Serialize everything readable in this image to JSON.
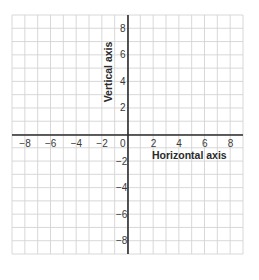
{
  "diagram": {
    "type": "coordinate-plane",
    "x_axis": {
      "title": "Horizontal axis",
      "range": [
        -9,
        9
      ],
      "tick_labels": [
        "−8",
        "−6",
        "−4",
        "−2",
        "0",
        "2",
        "4",
        "6",
        "8"
      ],
      "tick_values": [
        -8,
        -6,
        -4,
        -2,
        0,
        2,
        4,
        6,
        8
      ]
    },
    "y_axis": {
      "title": "Vertical axis",
      "range": [
        -9,
        9
      ],
      "tick_labels_positive": [
        "8",
        "6",
        "4",
        "2"
      ],
      "tick_values_positive": [
        8,
        6,
        4,
        2
      ],
      "tick_labels_negative": [
        "−2",
        "−4",
        "−6",
        "−8"
      ],
      "tick_values_negative": [
        -2,
        -4,
        -6,
        -8
      ]
    },
    "grid": {
      "columns": 18,
      "rows": 18,
      "unit": 1
    },
    "colors": {
      "grid_line": "#d4d4d4",
      "axis_line": "#2b2b2b",
      "label_text": "#3a3a3a",
      "background": "#ffffff"
    }
  }
}
